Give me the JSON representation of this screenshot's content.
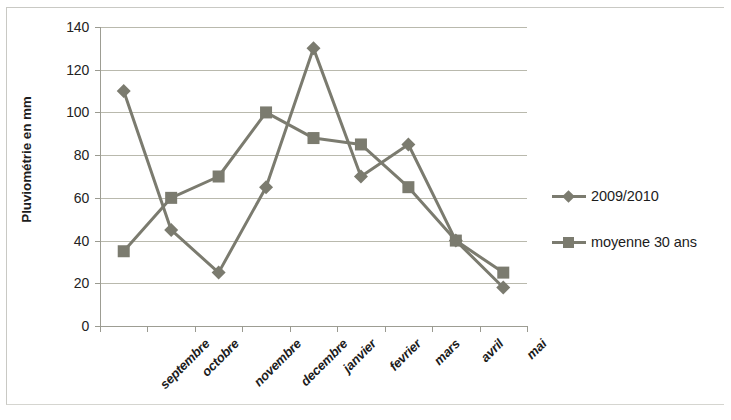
{
  "chart_data": {
    "type": "line",
    "title": "",
    "xlabel": "",
    "ylabel": "Pluviométrie en mm",
    "ylim": [
      0,
      140
    ],
    "ytick_step": 20,
    "yticks": [
      "0",
      "20",
      "40",
      "60",
      "80",
      "100",
      "120",
      "140"
    ],
    "grid": true,
    "legend_position": "right",
    "categories": [
      "septembre",
      "octobre",
      "novembre",
      "decembre",
      "janvier",
      "fevrier",
      "mars",
      "avril",
      "mai"
    ],
    "series": [
      {
        "name": "2009/2010",
        "marker": "diamond",
        "color": "#7b7b6f",
        "values": [
          110,
          45,
          25,
          65,
          130,
          70,
          85,
          40,
          18
        ]
      },
      {
        "name": "moyenne 30 ans",
        "marker": "square",
        "color": "#7b7b6f",
        "values": [
          35,
          60,
          70,
          100,
          88,
          85,
          65,
          40,
          25
        ]
      }
    ]
  },
  "legend": {
    "items": [
      {
        "label": "2009/2010",
        "marker": "diamond"
      },
      {
        "label": "moyenne 30 ans",
        "marker": "square"
      }
    ]
  },
  "colors": {
    "series": "#7b7b6f",
    "gridline": "#b9b9ad",
    "axis": "#9d9d93",
    "text": "#1c1c1c"
  }
}
